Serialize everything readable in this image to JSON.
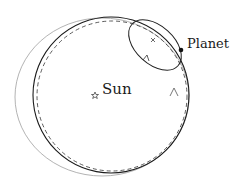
{
  "diagram": {
    "type": "orbit-epicycle",
    "labels": {
      "planet": "Planet",
      "sun": "Sun"
    },
    "colors": {
      "orbit": "#1a1a1a",
      "dashed_orbit": "#333333",
      "deferent": "#9a9a9a",
      "epicycle": "#222222",
      "background": "#ffffff"
    },
    "elements": [
      {
        "name": "sun",
        "symbol": "star",
        "x": 95,
        "y": 95
      },
      {
        "name": "planet",
        "symbol": "dot",
        "x": 181,
        "y": 50
      },
      {
        "name": "orbit-solid",
        "cx": 110,
        "cy": 95,
        "r": 78
      },
      {
        "name": "orbit-dashed",
        "cx": 112,
        "cy": 96,
        "r": 75
      },
      {
        "name": "deferent-gray",
        "cx": 103,
        "cy": 96,
        "rx": 88,
        "ry": 80
      },
      {
        "name": "epicycle-ellipse",
        "cx": 156,
        "cy": 45,
        "rx": 30,
        "ry": 19,
        "rotate": 40
      }
    ]
  }
}
